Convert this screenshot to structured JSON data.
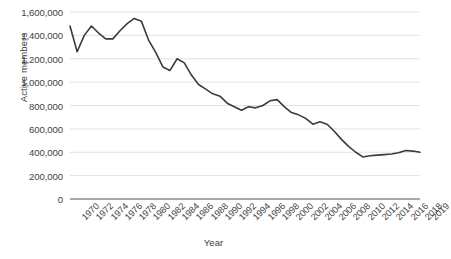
{
  "chart_data": {
    "type": "line",
    "title": "",
    "xlabel": "Year",
    "ylabel": "Active members",
    "ylim": [
      0,
      1600000
    ],
    "xlim": [
      1970,
      2019
    ],
    "grid": true,
    "legend": false,
    "line_color": "#3b3b3b",
    "gridline_color": "#e2e2e2",
    "axis_color": "#8c8c8c",
    "ytick_labels": [
      "1,600,000",
      "1,400,000",
      "1,200,000",
      "1,000,000",
      "800,000",
      "600,000",
      "400,000",
      "200,000",
      "0"
    ],
    "ytick_values": [
      1600000,
      1400000,
      1200000,
      1000000,
      800000,
      600000,
      400000,
      200000,
      0
    ],
    "xtick_labels": [
      "1970",
      "1972",
      "1974",
      "1976",
      "1978",
      "1980",
      "1982",
      "1984",
      "1986",
      "1988",
      "1990",
      "1992",
      "1994",
      "1996",
      "1998",
      "2000",
      "2002",
      "2004",
      "2006",
      "2008",
      "2010",
      "2012",
      "2014",
      "2016",
      "2018",
      "2019"
    ],
    "xtick_values": [
      1970,
      1972,
      1974,
      1976,
      1978,
      1980,
      1982,
      1984,
      1986,
      1988,
      1990,
      1992,
      1994,
      1996,
      1998,
      2000,
      2002,
      2004,
      2006,
      2008,
      2010,
      2012,
      2014,
      2016,
      2018,
      2019
    ],
    "x": [
      1970,
      1971,
      1972,
      1973,
      1974,
      1975,
      1976,
      1977,
      1978,
      1979,
      1980,
      1981,
      1982,
      1983,
      1984,
      1985,
      1986,
      1987,
      1988,
      1989,
      1990,
      1991,
      1992,
      1993,
      1994,
      1995,
      1996,
      1997,
      1998,
      1999,
      2000,
      2001,
      2002,
      2003,
      2004,
      2005,
      2006,
      2007,
      2008,
      2009,
      2010,
      2011,
      2012,
      2013,
      2014,
      2015,
      2016,
      2017,
      2018,
      2019
    ],
    "values": [
      1480000,
      1260000,
      1400000,
      1480000,
      1420000,
      1370000,
      1370000,
      1440000,
      1500000,
      1545000,
      1520000,
      1360000,
      1255000,
      1130000,
      1100000,
      1200000,
      1165000,
      1060000,
      980000,
      940000,
      900000,
      880000,
      820000,
      790000,
      760000,
      790000,
      780000,
      800000,
      840000,
      850000,
      790000,
      740000,
      720000,
      690000,
      640000,
      660000,
      640000,
      580000,
      510000,
      450000,
      400000,
      360000,
      370000,
      375000,
      380000,
      385000,
      395000,
      415000,
      410000,
      400000
    ],
    "series_name": "Active members"
  }
}
